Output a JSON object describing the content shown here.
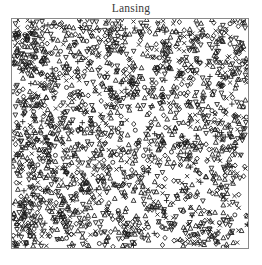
{
  "figure": {
    "title": "Lansing",
    "title_color": "#3a3a3a",
    "background": "#ffffff",
    "frame_color": "#8a8a8a",
    "marker_color": "#1a1a1a"
  },
  "chart_data": {
    "type": "scatter",
    "title": "Lansing",
    "xlabel": "",
    "ylabel": "",
    "xlim": [
      0,
      1
    ],
    "ylim": [
      0,
      1
    ],
    "grid": false,
    "legend": "none",
    "axis_ticks": "none",
    "frame": "box",
    "n_points": 2251,
    "marker_glyphs": [
      "circle",
      "triangle-up",
      "triangle-down",
      "plus",
      "diamond",
      "cross"
    ],
    "series": [
      {
        "name": "blackoak",
        "glyph": "circle",
        "n": 135
      },
      {
        "name": "hickory",
        "glyph": "triangle-up",
        "n": 703
      },
      {
        "name": "maple",
        "glyph": "triangle-down",
        "n": 514
      },
      {
        "name": "misc",
        "glyph": "plus",
        "n": 105
      },
      {
        "name": "redoak",
        "glyph": "diamond",
        "n": 346
      },
      {
        "name": "whiteoak",
        "glyph": "cross",
        "n": 448
      }
    ],
    "density_note": "Heaviest clustering along the left margin and lower-left quadrant; a sparser diagonal band runs from mid-left toward the upper-right."
  }
}
